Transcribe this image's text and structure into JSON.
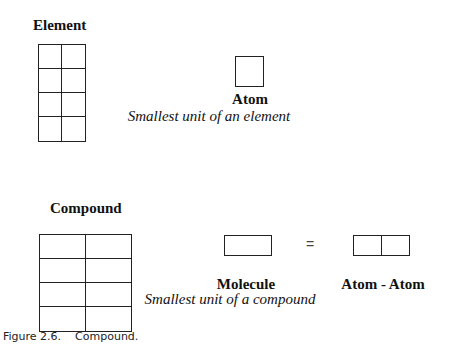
{
  "element_section": {
    "title": "Element",
    "grid": {
      "rows": 4,
      "cols": 2
    },
    "atom_label": "Atom",
    "atom_description": "Smallest unit of an element"
  },
  "compound_section": {
    "title": "Compound",
    "grid": {
      "rows": 4,
      "cols": 2
    },
    "molecule_label": "Molecule",
    "molecule_description": "Smallest unit of a compound",
    "equals_sign": "=",
    "atom_atom_label": "Atom - Atom"
  },
  "caption": {
    "figure_number": "Figure 2.6.",
    "figure_title": "Compound."
  }
}
